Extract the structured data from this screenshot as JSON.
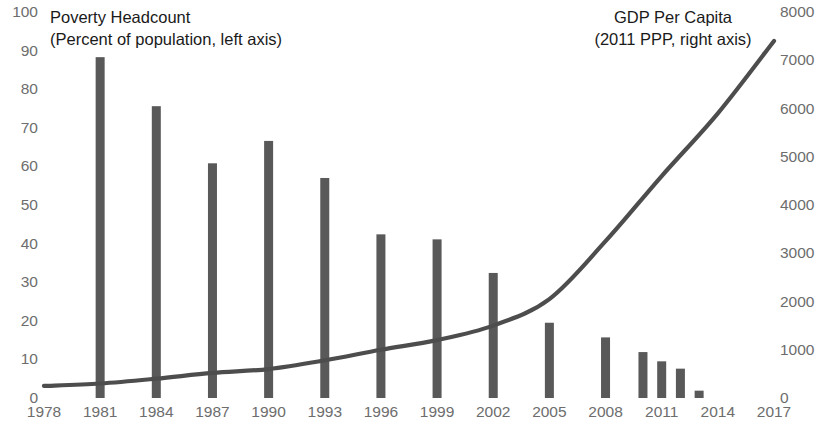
{
  "chart_data": {
    "type": "bar",
    "title": "",
    "xlabel": "",
    "x": [
      1978,
      1981,
      1984,
      1987,
      1990,
      1993,
      1996,
      1999,
      2002,
      2005,
      2008,
      2010,
      2011,
      2012,
      2013,
      2014,
      2017
    ],
    "xtick_labels": [
      "1978",
      "1981",
      "1984",
      "1987",
      "1990",
      "1993",
      "1996",
      "1999",
      "2002",
      "2005",
      "2008",
      "2011",
      "2014",
      "2017"
    ],
    "xtick_values": [
      1978,
      1981,
      1984,
      1987,
      1990,
      1993,
      1996,
      1999,
      2002,
      2005,
      2008,
      2011,
      2014,
      2017
    ],
    "xlim": [
      1978,
      2017
    ],
    "left_axis": {
      "label": "Poverty Headcount",
      "sublabel": "(Percent of population, left axis)",
      "ylabel": "Percent of population",
      "ylim": [
        0,
        100
      ],
      "ticks": [
        0,
        10,
        20,
        30,
        40,
        50,
        60,
        70,
        80,
        90,
        100
      ],
      "tick_labels": [
        "0",
        "10",
        "20",
        "30",
        "40",
        "50",
        "60",
        "70",
        "80",
        "90",
        "100"
      ],
      "grid": false
    },
    "right_axis": {
      "label": "GDP Per Capita",
      "sublabel": "(2011 PPP, right axis)",
      "ylabel": "GDP per capita (2011 PPP)",
      "ylim": [
        0,
        8000
      ],
      "ticks": [
        0,
        1000,
        2000,
        3000,
        4000,
        5000,
        6000,
        7000,
        8000
      ],
      "tick_labels": [
        "0",
        "1000",
        "2000",
        "3000",
        "4000",
        "5000",
        "6000",
        "7000",
        "8000"
      ],
      "grid": false
    },
    "series": [
      {
        "name": "Poverty Headcount",
        "type": "bar",
        "axis": "left",
        "color": "#595959",
        "x": [
          1981,
          1984,
          1987,
          1990,
          1993,
          1996,
          1999,
          2002,
          2005,
          2008,
          2010,
          2011,
          2012,
          2013
        ],
        "values": [
          88.3,
          75.6,
          60.8,
          66.6,
          57.0,
          42.4,
          41.1,
          32.4,
          19.5,
          15.7,
          11.9,
          9.5,
          7.6,
          1.9
        ]
      },
      {
        "name": "GDP Per Capita",
        "type": "line",
        "axis": "right",
        "color": "#4d4d4d",
        "x": [
          1978,
          1981,
          1984,
          1987,
          1990,
          1993,
          1996,
          1999,
          2002,
          2005,
          2008,
          2011,
          2014,
          2017
        ],
        "values": [
          250,
          300,
          400,
          520,
          600,
          780,
          1000,
          1200,
          1500,
          2050,
          3250,
          4600,
          5900,
          7400
        ]
      }
    ],
    "legend": {
      "position": "inline-annotations",
      "entries": [
        "Poverty Headcount (Percent of population, left axis)",
        "GDP Per Capita (2011 PPP, right axis)"
      ]
    },
    "colors": {
      "bar": "#595959",
      "line": "#4d4d4d",
      "tick_label": "#6d6d6d",
      "annotation": "#1a1a1a",
      "background": "#ffffff"
    }
  }
}
